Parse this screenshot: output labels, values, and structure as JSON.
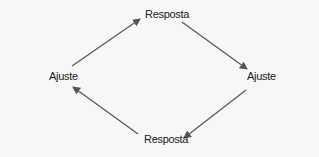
{
  "diagram": {
    "type": "cycle",
    "nodes": [
      {
        "id": "top",
        "label": "Resposta"
      },
      {
        "id": "right",
        "label": "Ajuste"
      },
      {
        "id": "bottom",
        "label": "Resposta"
      },
      {
        "id": "left",
        "label": "Ajuste"
      }
    ],
    "edges": [
      {
        "from": "left",
        "to": "top"
      },
      {
        "from": "top",
        "to": "right"
      },
      {
        "from": "right",
        "to": "bottom"
      },
      {
        "from": "bottom",
        "to": "left"
      }
    ],
    "colors": {
      "background": "#f7f7f7",
      "arrow": "#555555",
      "text": "#1a1a1a"
    }
  }
}
